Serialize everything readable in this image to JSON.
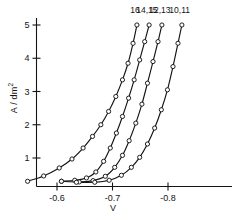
{
  "chart_data": {
    "type": "line",
    "title": "",
    "xlabel": "V",
    "ylabel": "A / dm2",
    "ylabel_base": "A / dm",
    "ylabel_exponent": "2",
    "xlim": [
      -0.545,
      -0.845
    ],
    "ylim": [
      0,
      5.45
    ],
    "grid": false,
    "legend_position": "inline-curve-end-labels",
    "marker": "open-circle",
    "line_color": "#141414",
    "xticks": [
      -0.6,
      -0.7,
      -0.8
    ],
    "xticklabels": [
      "-0.6",
      "-0.7",
      "-0.8"
    ],
    "yticks": [
      1,
      2,
      3,
      4,
      5
    ],
    "yticklabels": [
      "1",
      "2",
      "3",
      "4",
      "5"
    ],
    "series": [
      {
        "name": "16",
        "label": "16",
        "x": [
          -0.547,
          -0.576,
          -0.604,
          -0.627,
          -0.647,
          -0.664,
          -0.679,
          -0.693,
          -0.706,
          -0.718,
          -0.728,
          -0.737,
          -0.744
        ],
        "y": [
          0.3,
          0.46,
          0.7,
          0.97,
          1.3,
          1.65,
          2.0,
          2.4,
          2.85,
          3.35,
          3.85,
          4.45,
          5.0
        ]
      },
      {
        "name": "14,15",
        "label": "14,15",
        "x": [
          -0.608,
          -0.632,
          -0.653,
          -0.67,
          -0.684,
          -0.696,
          -0.707,
          -0.718,
          -0.729,
          -0.739,
          -0.749,
          -0.758,
          -0.766
        ],
        "y": [
          0.3,
          0.33,
          0.4,
          0.58,
          0.9,
          1.3,
          1.75,
          2.25,
          2.8,
          3.35,
          3.95,
          4.5,
          5.0
        ]
      },
      {
        "name": "12,13",
        "label": "12,13",
        "x": [
          -0.608,
          -0.64,
          -0.665,
          -0.687,
          -0.704,
          -0.718,
          -0.73,
          -0.742,
          -0.753,
          -0.763,
          -0.773,
          -0.782,
          -0.789
        ],
        "y": [
          0.3,
          0.28,
          0.32,
          0.45,
          0.72,
          1.08,
          1.52,
          2.05,
          2.62,
          3.25,
          3.9,
          4.5,
          5.0
        ]
      },
      {
        "name": "10,11",
        "label": "10,11",
        "x": [
          -0.635,
          -0.668,
          -0.694,
          -0.716,
          -0.734,
          -0.749,
          -0.763,
          -0.776,
          -0.788,
          -0.799,
          -0.809,
          -0.818,
          -0.825
        ],
        "y": [
          0.27,
          0.27,
          0.33,
          0.48,
          0.72,
          1.02,
          1.42,
          1.9,
          2.45,
          3.05,
          3.75,
          4.45,
          5.0
        ]
      }
    ],
    "curve_end_labels": [
      {
        "text": "16",
        "x": -0.7405,
        "y": 5.37
      },
      {
        "text": "14,15",
        "x": -0.762,
        "y": 5.37
      },
      {
        "text": "12,13",
        "x": -0.7855,
        "y": 5.37
      },
      {
        "text": "10,11",
        "x": -0.821,
        "y": 5.37
      }
    ]
  }
}
